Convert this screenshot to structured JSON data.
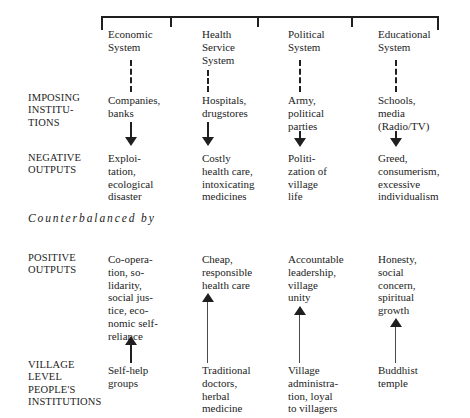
{
  "diagram": {
    "counterbalance_text": "Counterbalanced by",
    "row_labels": {
      "imposing": "IMPOSING\nINSTITU-\nTIONS",
      "negative": "NEGATIVE\nOUTPUTS",
      "positive": "POSITIVE\nOUTPUTS",
      "village": "VILLAGE\nLEVEL\nPEOPLE'S\nINSTITUTIONS"
    },
    "columns": [
      {
        "system": "Economic\nSystem",
        "imposing": "Companies,\nbanks",
        "negative": "Exploi-\ntation,\necological\ndisaster",
        "positive": "Co-opera-\ntion, so-\nlidarity,\nsocial jus-\ntice, eco-\nnomic self-\nreliance",
        "village": "Self-help\ngroups"
      },
      {
        "system": "Health\nService\nSystem",
        "imposing": "Hospitals,\ndrugstores",
        "negative": "Costly\nhealth care,\nintoxicating\nmedicines",
        "positive": "Cheap,\nresponsible\nhealth care",
        "village": "Traditional\ndoctors,\nherbal\nmedicine"
      },
      {
        "system": "Political\nSystem",
        "imposing": "Army,\npolitical\nparties",
        "negative": "Politi-\nzation of\nvillage\nlife",
        "positive": "Accountable\nleadership,\nvillage\nunity",
        "village": "Village\nadministra-\ntion, loyal\nto villagers"
      },
      {
        "system": "Educational\nSystem",
        "imposing": "Schools,\nmedia\n(Radio/TV)",
        "negative": "Greed,\nconsumerism,\nexcessive\nindividualism",
        "positive": "Honesty,\nsocial\nconcern,\nspiritual\ngrowth",
        "village": "Buddhist\ntemple"
      }
    ],
    "colors": {
      "ink": "#1f1f1f",
      "background": "#ffffff"
    }
  }
}
